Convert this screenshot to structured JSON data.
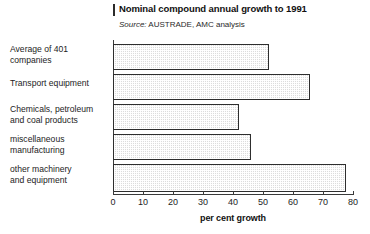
{
  "chart_data": {
    "type": "bar",
    "orientation": "horizontal",
    "title": "Nominal compound annual growth to 1991",
    "source_label": "Source:",
    "source_text": " AUSTRADE, AMC analysis",
    "xlabel": "per cent growth",
    "ylabel": "",
    "xlim": [
      0,
      80
    ],
    "xticks": [
      0,
      10,
      20,
      30,
      40,
      50,
      60,
      70,
      80
    ],
    "xtick_labels": [
      "0",
      "10",
      "20",
      "30",
      "40",
      "50",
      "60",
      "70",
      "80"
    ],
    "grid": false,
    "legend": false,
    "categories": [
      "Average of 401 companies",
      "Transport equipment",
      "Chemicals, petroleum and coal products",
      "miscellaneous manufacturing",
      "other machinery and equipment"
    ],
    "category_label_lines": [
      [
        "Average of 401",
        "companies"
      ],
      [
        "Transport equipment"
      ],
      [
        "Chemicals, petroleum",
        "and coal products"
      ],
      [
        "miscellaneous",
        "manufacturing"
      ],
      [
        "other machinery",
        "and equipment"
      ]
    ],
    "values": [
      52,
      65.5,
      42,
      46,
      77.5
    ],
    "bar_fill_color": "#dcdcdc",
    "bar_edge_color": "#2e2e2e",
    "axis_color": "#3a3a3a",
    "background_color": "#ffffff"
  }
}
